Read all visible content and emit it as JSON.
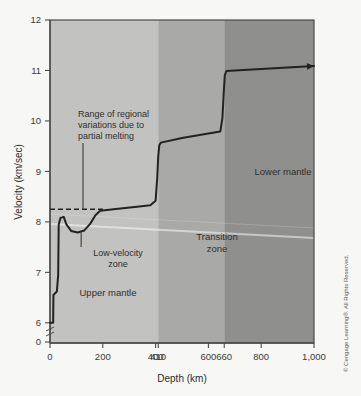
{
  "figure": {
    "credit": "© Cengage Learning®. All Rights Reserved."
  },
  "chart_data": {
    "type": "line",
    "title": "",
    "xlabel": "Depth (km)",
    "ylabel": "Velocity (km/sec)",
    "xlim": [
      0,
      1000
    ],
    "ylim": [
      5.6,
      12
    ],
    "grid": false,
    "legend_position": "none",
    "x_ticks": [
      {
        "value": 0,
        "label": "0"
      },
      {
        "value": 200,
        "label": "200"
      },
      {
        "value": 400,
        "label": "400"
      },
      {
        "value": 410,
        "label": "410"
      },
      {
        "value": 600,
        "label": "600"
      },
      {
        "value": 660,
        "label": "660"
      },
      {
        "value": 800,
        "label": "800"
      },
      {
        "value": 1000,
        "label": "1,000"
      }
    ],
    "y_ticks": [
      {
        "value": 12,
        "label": "12"
      },
      {
        "value": 11,
        "label": "11"
      },
      {
        "value": 10,
        "label": "10"
      },
      {
        "value": 9,
        "label": "9"
      },
      {
        "value": 8,
        "label": "8"
      },
      {
        "value": 7,
        "label": "7"
      },
      {
        "value": 6,
        "label": "6"
      },
      {
        "value": 5.62,
        "label": "0"
      }
    ],
    "axis_break": true,
    "series": [
      {
        "name": "Seismic P-wave velocity",
        "color": "#222222",
        "arrow_end": true,
        "points": [
          [
            0,
            6.0
          ],
          [
            12,
            6.0
          ],
          [
            13,
            6.55
          ],
          [
            26,
            6.62
          ],
          [
            31,
            6.95
          ],
          [
            33,
            7.95
          ],
          [
            40,
            8.08
          ],
          [
            52,
            8.1
          ],
          [
            62,
            7.95
          ],
          [
            80,
            7.82
          ],
          [
            105,
            7.79
          ],
          [
            130,
            7.83
          ],
          [
            152,
            7.96
          ],
          [
            172,
            8.13
          ],
          [
            190,
            8.22
          ],
          [
            240,
            8.25
          ],
          [
            330,
            8.3
          ],
          [
            380,
            8.33
          ],
          [
            400,
            8.42
          ],
          [
            406,
            8.85
          ],
          [
            410,
            9.3
          ],
          [
            414,
            9.52
          ],
          [
            420,
            9.57
          ],
          [
            500,
            9.66
          ],
          [
            600,
            9.75
          ],
          [
            645,
            9.79
          ],
          [
            653,
            10.05
          ],
          [
            658,
            10.55
          ],
          [
            662,
            10.9
          ],
          [
            668,
            10.99
          ],
          [
            700,
            11.0
          ],
          [
            800,
            11.03
          ],
          [
            900,
            11.06
          ],
          [
            1000,
            11.09
          ]
        ]
      }
    ],
    "reference_line": {
      "name": "Range of regional variations reference",
      "style": "dashed",
      "color": "#222222",
      "y": 8.25,
      "x_start": 0,
      "x_end": 205
    },
    "zones": [
      {
        "name": "Upper mantle",
        "label": "Upper mantle",
        "x_start": 0,
        "x_end": 410,
        "color": "#c2c2c0"
      },
      {
        "name": "Transition zone",
        "label": "Transition\nzone",
        "x_start": 410,
        "x_end": 660,
        "color": "#a9a9a7"
      },
      {
        "name": "Lower mantle",
        "label": "Lower mantle",
        "x_start": 660,
        "x_end": 1000,
        "color": "#8f8f8d"
      }
    ],
    "annotations": [
      {
        "name": "partial-melting-note",
        "lines": [
          "Range of regional",
          "variations due to",
          "partial melting"
        ],
        "leader_to_x": 125,
        "leader_to_y": 8.25
      },
      {
        "name": "low-velocity-zone-label",
        "lines": [
          "Low-velocity",
          "zone"
        ],
        "leader_to_x": 118,
        "leader_to_y": 7.79
      }
    ]
  }
}
